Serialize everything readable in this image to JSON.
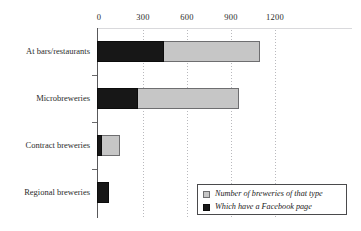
{
  "chart_data": {
    "type": "bar",
    "orientation": "horizontal",
    "stacked": false,
    "title": "",
    "subtitle": "",
    "xlabel": "",
    "ylabel": "",
    "xlim": [
      0,
      1200
    ],
    "categories": [
      "At bars/restaurants",
      "Microbreweries",
      "Contract breweries",
      "Regional breweries"
    ],
    "series": [
      {
        "name": "Number of breweries of that type",
        "color": "#c6c6c6",
        "values": [
          1110,
          970,
          155,
          0
        ]
      },
      {
        "name": "Which have a Facebook page",
        "color": "#171717",
        "values": [
          460,
          280,
          35,
          80
        ]
      }
    ],
    "xticks": [
      0,
      300,
      600,
      900,
      1200
    ],
    "xtick_labels": [
      "0",
      "300",
      "600",
      "900",
      "1200"
    ],
    "grid": true,
    "grid_style": "dotted-vertical",
    "legend_position": "bottom-right",
    "axis_position": "top"
  },
  "legend": {
    "items": [
      {
        "label": "Number of breweries of that type",
        "swatch": "legend-swatch-total"
      },
      {
        "label": "Which have a Facebook page",
        "swatch": "legend-swatch-facebook"
      }
    ]
  }
}
